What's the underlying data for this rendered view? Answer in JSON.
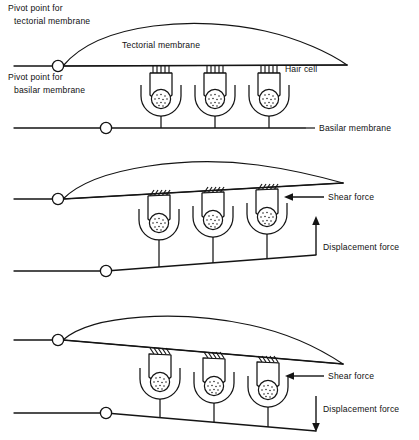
{
  "figure": {
    "ink_color": "#141414",
    "background_color": "#ffffff",
    "panel_count": 3
  },
  "labels": {
    "pivot_tectorial_line1": "Pivot point for",
    "pivot_tectorial_line2": "tectorial membrane",
    "pivot_basilar_line1": "Pivot point for",
    "pivot_basilar_line2": "basilar membrane",
    "tectorial_membrane": "Tectorial membrane",
    "hair_cell": "Hair cell",
    "basilar_membrane": "Basilar membrane",
    "shear_force": "Shear force",
    "displacement_force": "Displacement force"
  },
  "panels": [
    {
      "index": 1,
      "name": "resting-state",
      "state": "rest",
      "tectorial_tilt": "level",
      "basilar_tilt": "level",
      "cilia_orientation": "vertical",
      "hair_cell_count": 3,
      "shear_force_shown": false,
      "displacement_force_shown": false,
      "annotations": [
        "Pivot point for tectorial membrane",
        "Pivot point for basilar membrane",
        "Tectorial membrane",
        "Hair cell",
        "Basilar membrane"
      ]
    },
    {
      "index": 2,
      "name": "upward-displacement",
      "state": "displaced-up",
      "tectorial_tilt": "up",
      "basilar_tilt": "up",
      "cilia_orientation": "sheared-right",
      "hair_cell_count": 3,
      "shear_force_shown": true,
      "shear_force_direction": "left",
      "displacement_force_shown": true,
      "displacement_force_direction": "up",
      "annotations": [
        "Shear force",
        "Displacement force"
      ]
    },
    {
      "index": 3,
      "name": "downward-displacement",
      "state": "displaced-down",
      "tectorial_tilt": "down",
      "basilar_tilt": "down",
      "cilia_orientation": "sheared-left",
      "hair_cell_count": 3,
      "shear_force_shown": true,
      "shear_force_direction": "left",
      "displacement_force_shown": true,
      "displacement_force_direction": "down",
      "annotations": [
        "Shear force",
        "Displacement force"
      ]
    }
  ]
}
